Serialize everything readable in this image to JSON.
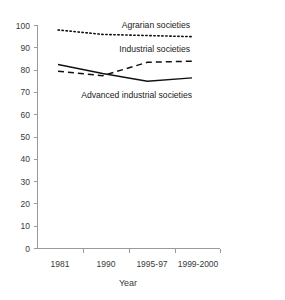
{
  "chart_data": {
    "type": "line",
    "title": "",
    "xlabel": "Year",
    "ylabel": "",
    "categories": [
      "1981",
      "1990",
      "1995-97",
      "1999-2000"
    ],
    "ylim": [
      0,
      100
    ],
    "xlim_note": "categorical, evenly spaced",
    "yticks": [
      0,
      10,
      20,
      30,
      40,
      50,
      60,
      70,
      80,
      90,
      100
    ],
    "ytick_labels": [
      "0",
      "10",
      "20",
      "30",
      "40",
      "50",
      "60",
      "70",
      "80",
      "90",
      "100"
    ],
    "grid": false,
    "legend": "inline-labels",
    "series": [
      {
        "name": "Agrarian societies",
        "style": "dotted",
        "color": "#111111",
        "values": [
          98,
          96,
          95.5,
          95
        ]
      },
      {
        "name": "Industrial societies",
        "style": "dashed",
        "color": "#111111",
        "values": [
          79.5,
          77.5,
          83.5,
          84
        ]
      },
      {
        "name": "Advanced industrial societies",
        "style": "solid",
        "color": "#111111",
        "values": [
          82.5,
          78.5,
          75,
          76.5
        ]
      }
    ],
    "annotations": [
      {
        "text": "Agrarian societies",
        "near_series": "Agrarian societies"
      },
      {
        "text": "Industrial societies",
        "near_series": "Industrial societies"
      },
      {
        "text": "Advanced industrial societies",
        "near_series": "Advanced industrial societies"
      }
    ]
  },
  "axes": {
    "y_labels": [
      "100",
      "90",
      "80",
      "70",
      "60",
      "50",
      "40",
      "30",
      "20",
      "10",
      "0"
    ],
    "x_labels": [
      "1981",
      "1990",
      "1995-97",
      "1999-2000"
    ],
    "x_title": "Year"
  },
  "series_labels": {
    "agrarian": "Agrarian societies",
    "industrial": "Industrial societies",
    "advanced": "Advanced industrial societies"
  }
}
